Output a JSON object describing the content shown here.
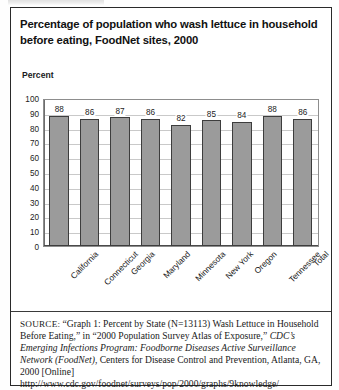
{
  "document": {
    "title_line_1": "Percentage of population who wash lettuce in household",
    "title_line_2": "before eating, FoodNet sites, 2000"
  },
  "chart_data": {
    "type": "bar",
    "title": "Percentage of population who wash lettuce in household before eating, FoodNet sites, 2000",
    "categories": [
      "California",
      "Connecticut",
      "Georgia",
      "Maryland",
      "Minnesota",
      "New York",
      "Oregon",
      "Tennessee",
      "Total"
    ],
    "values": [
      88,
      86,
      87,
      86,
      82,
      85,
      84,
      88,
      86
    ],
    "xlabel": "",
    "ylabel": "Percent",
    "ylim": [
      0,
      100
    ],
    "yticks": [
      100,
      90,
      80,
      70,
      60,
      50,
      40,
      30,
      20,
      10,
      0
    ],
    "grid": true,
    "legend": "none",
    "bar_color": "#9b9b9b",
    "bar_border_color": "#3d3d3d",
    "gridline_color": "#c9c9c9",
    "data_labels": true
  },
  "source": {
    "label": "SOURCE:",
    "text_part_1": "“Graph 1: Percent by State (N=13113) Wash Lettuce in Household Before Eating,” in “2000 Population Survey Atlas of Exposure,” ",
    "text_italic": "CDC’s Emerging Infections Program: Foodborne Diseases Active Surveillance Network (FoodNet)",
    "text_part_2": ", Centers for Disease Control and Prevention, Atlanta, GA, 2000 [Online]",
    "url": "http://www.cdc.gov/foodnet/surveys/pop/2000/graphs/9knowledge/"
  }
}
